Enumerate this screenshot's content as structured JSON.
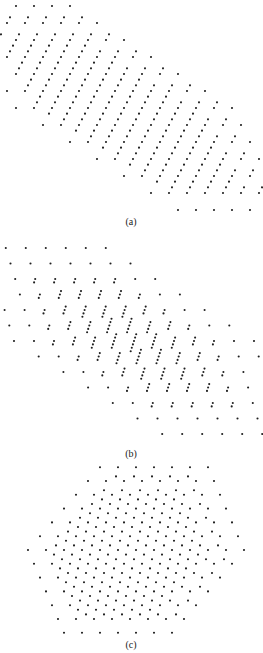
{
  "figure": {
    "width": 263,
    "height": 653,
    "dot_color": "#1f1f1f",
    "dot_radius": 1.05,
    "panels": [
      {
        "id": "a",
        "label": "(a)",
        "label_pos": [
          131,
          222
        ],
        "center": [
          124,
          108
        ],
        "U": [
          18,
          0
        ],
        "V": [
          -9,
          -17
        ],
        "radius": 6,
        "fine_steps": 3,
        "classes": [
          {
            "offset": [
              0,
              0
            ],
            "radius": 6.0,
            "shift": [
              0,
              0
            ]
          },
          {
            "offset": [
              1,
              1
            ],
            "radius": 5.3,
            "shift": [
              0.2,
              0.2
            ]
          },
          {
            "offset": [
              2,
              2
            ],
            "radius": 4.6,
            "shift": [
              -0.2,
              -0.2
            ]
          }
        ]
      },
      {
        "id": "b",
        "label": "(b)",
        "label_pos": [
          131,
          454
        ],
        "center": [
          134,
          341
        ],
        "U": [
          20,
          0
        ],
        "V": [
          -4.7,
          -15.5
        ],
        "radius": 6,
        "fine_steps": 1,
        "line_offsets": {
          "step": [
            -1.1,
            3.4
          ],
          "counts_by_ring": [
            6,
            5,
            4,
            3,
            2,
            1,
            1
          ]
        },
        "classes": [
          {
            "offset": [
              0,
              0
            ],
            "radius": 6.0,
            "shift": [
              0,
              0
            ]
          }
        ]
      },
      {
        "id": "c",
        "label": "(c)",
        "label_pos": [
          131,
          645
        ],
        "center": [
          136,
          550
        ],
        "U": [
          18,
          0
        ],
        "V": [
          12,
          -13.8
        ],
        "radius": 6,
        "fine_steps": 3,
        "classes": [
          {
            "offset": [
              0,
              0
            ],
            "radius": 6.0,
            "shift": [
              0,
              0
            ]
          },
          {
            "offset": [
              1,
              1
            ],
            "radius": 5.2,
            "shift": [
              0.2,
              0.2
            ]
          },
          {
            "offset": [
              2,
              2
            ],
            "radius": 4.4,
            "shift": [
              -0.2,
              -0.2
            ]
          }
        ]
      }
    ]
  },
  "captions": {
    "a": "(a)",
    "b": "(b)",
    "c": "(c)"
  }
}
